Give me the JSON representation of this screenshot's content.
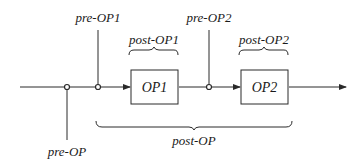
{
  "diagram": {
    "title": "",
    "colors": {
      "line": "#2a2a2a",
      "text": "#1a1a1a",
      "background": "#ffffff"
    },
    "main_line": {
      "direction": "left-to-right",
      "arrow_end": true
    },
    "boxes": [
      {
        "id": "op1",
        "label": "OP1"
      },
      {
        "id": "op2",
        "label": "OP2"
      }
    ],
    "nodes": [
      {
        "id": "n-pre-op",
        "tap_label": "pre-OP",
        "tap_direction": "down"
      },
      {
        "id": "n-pre-op1",
        "tap_label": "pre-OP1",
        "tap_direction": "up"
      },
      {
        "id": "n-pre-op2",
        "tap_label": "pre-OP2",
        "tap_direction": "up"
      }
    ],
    "braces": [
      {
        "id": "brace-post-op1",
        "label": "post-OP1",
        "spans": "OP1",
        "position": "above"
      },
      {
        "id": "brace-post-op2",
        "label": "post-OP2",
        "spans": "OP2",
        "position": "above"
      },
      {
        "id": "brace-post-op",
        "label": "post-OP",
        "spans": "pre-OP1 node to OP2",
        "position": "below"
      }
    ],
    "labels": {
      "pre_op": "pre-OP",
      "pre_op1": "pre-OP1",
      "pre_op2": "pre-OP2",
      "post_op1": "post-OP1",
      "post_op2": "post-OP2",
      "post_op": "post-OP",
      "op1": "OP1",
      "op2": "OP2"
    }
  }
}
